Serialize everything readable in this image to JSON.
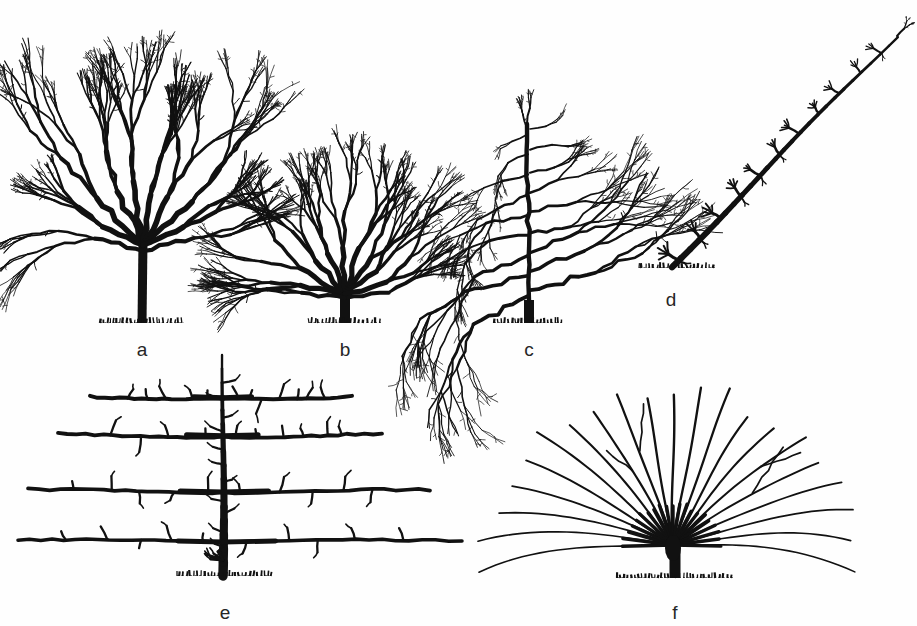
{
  "figure": {
    "kind": "botanical-line-drawing",
    "background_color": "#fefefe",
    "ink_color": "#111111",
    "width": 917,
    "height": 626
  },
  "panels": [
    {
      "id": "a",
      "label": "a",
      "form_name": "standard-tree",
      "label_x": 142,
      "label_y": 340,
      "ground": {
        "x": 142,
        "y": 323,
        "half_width": 42
      },
      "trunk": {
        "x": 142,
        "top_y": 241,
        "bottom_y": 323,
        "width": 9
      },
      "canopy": {
        "center_x": 145,
        "top_y": 28,
        "left_x": 28,
        "right_x": 268
      },
      "bbox": {
        "x": 24,
        "y": 26,
        "w": 250,
        "h": 300
      }
    },
    {
      "id": "b",
      "label": "b",
      "form_name": "bush-tree",
      "label_x": 345,
      "label_y": 340,
      "ground": {
        "x": 345,
        "y": 323,
        "half_width": 36
      },
      "trunk": {
        "x": 345,
        "top_y": 292,
        "bottom_y": 323,
        "width": 10
      },
      "canopy": {
        "center_x": 345,
        "top_y": 134,
        "left_x": 258,
        "right_x": 438
      },
      "bbox": {
        "x": 256,
        "y": 132,
        "w": 186,
        "h": 194
      }
    },
    {
      "id": "c",
      "label": "c",
      "form_name": "pyramid-spindle-tree",
      "label_x": 529,
      "label_y": 340,
      "ground": {
        "x": 529,
        "y": 323,
        "half_width": 35
      },
      "trunk": {
        "x": 529,
        "top_y": 300,
        "bottom_y": 323,
        "width": 10
      },
      "canopy": {
        "center_x": 529,
        "top_y": 118,
        "left_x": 448,
        "right_x": 614
      },
      "bbox": {
        "x": 446,
        "y": 116,
        "w": 172,
        "h": 210
      }
    },
    {
      "id": "d",
      "label": "d",
      "form_name": "oblique-cordon",
      "label_x": 671,
      "label_y": 290,
      "ground": {
        "x": 677,
        "y": 268,
        "half_width": 38
      },
      "stem": {
        "base_x": 672,
        "base_y": 266,
        "tip_x": 897,
        "tip_y": 36
      },
      "bbox": {
        "x": 636,
        "y": 32,
        "w": 268,
        "h": 240
      }
    },
    {
      "id": "e",
      "label": "e",
      "form_name": "horizontal-espalier",
      "label_x": 225,
      "label_y": 603,
      "ground": {
        "x": 225,
        "y": 576,
        "half_width": 48
      },
      "trunk": {
        "x": 223,
        "top_y": 355,
        "bottom_y": 576,
        "width": 8
      },
      "tiers": [
        {
          "y": 398,
          "left_x": 90,
          "right_x": 352
        },
        {
          "y": 436,
          "left_x": 58,
          "right_x": 382
        },
        {
          "y": 492,
          "left_x": 28,
          "right_x": 430
        },
        {
          "y": 542,
          "left_x": 18,
          "right_x": 462
        }
      ],
      "tier_count": 4,
      "bbox": {
        "x": 16,
        "y": 352,
        "w": 450,
        "h": 230
      }
    },
    {
      "id": "f",
      "label": "f",
      "form_name": "fan-trained-tree",
      "label_x": 675,
      "label_y": 603,
      "ground": {
        "x": 675,
        "y": 578,
        "half_width": 58
      },
      "trunk": {
        "x": 675,
        "top_y": 548,
        "bottom_y": 578,
        "width": 11
      },
      "crown": {
        "center_x": 673,
        "center_y": 545,
        "top_y": 352,
        "left_x": 500,
        "right_x": 866
      },
      "rib_count": 21,
      "bbox": {
        "x": 498,
        "y": 350,
        "w": 372,
        "h": 234
      }
    }
  ]
}
